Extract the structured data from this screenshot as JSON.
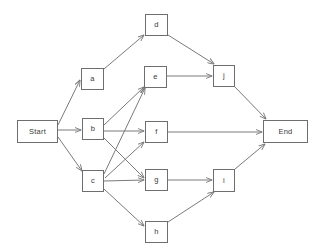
{
  "diagram": {
    "background_color": "#ffffff",
    "node_border_color": "#6e6e6e",
    "edge_color": "#7a7a7a",
    "text_color": "#3a3a3a",
    "nodes": [
      {
        "id": "start",
        "label": "Start",
        "x": 17,
        "y": 120,
        "w": 41,
        "h": 23
      },
      {
        "id": "a",
        "label": "a",
        "x": 81,
        "y": 68,
        "w": 23,
        "h": 22
      },
      {
        "id": "b",
        "label": "b",
        "x": 82,
        "y": 118,
        "w": 22,
        "h": 22
      },
      {
        "id": "c",
        "label": "c",
        "x": 82,
        "y": 170,
        "w": 22,
        "h": 22
      },
      {
        "id": "d",
        "label": "d",
        "x": 145,
        "y": 14,
        "w": 23,
        "h": 22
      },
      {
        "id": "e",
        "label": "e",
        "x": 144,
        "y": 66,
        "w": 23,
        "h": 22
      },
      {
        "id": "f",
        "label": "f",
        "x": 145,
        "y": 121,
        "w": 23,
        "h": 22
      },
      {
        "id": "g",
        "label": "g",
        "x": 145,
        "y": 169,
        "w": 23,
        "h": 22
      },
      {
        "id": "h",
        "label": "h",
        "x": 145,
        "y": 221,
        "w": 23,
        "h": 22
      },
      {
        "id": "j",
        "label": "j",
        "x": 213,
        "y": 65,
        "w": 22,
        "h": 22
      },
      {
        "id": "i",
        "label": "i",
        "x": 213,
        "y": 169,
        "w": 22,
        "h": 23
      },
      {
        "id": "end",
        "label": "End",
        "x": 263,
        "y": 120,
        "w": 45,
        "h": 23
      }
    ],
    "edges": [
      {
        "from": "start",
        "to": "a",
        "x1": 58,
        "y1": 125,
        "x2": 80,
        "y2": 80
      },
      {
        "from": "start",
        "to": "b",
        "x1": 58,
        "y1": 130,
        "x2": 81,
        "y2": 130
      },
      {
        "from": "start",
        "to": "c",
        "x1": 58,
        "y1": 137,
        "x2": 82,
        "y2": 171
      },
      {
        "from": "a",
        "to": "d",
        "x1": 104,
        "y1": 69,
        "x2": 144,
        "y2": 35
      },
      {
        "from": "d",
        "to": "j",
        "x1": 168,
        "y1": 35,
        "x2": 214,
        "y2": 64
      },
      {
        "from": "b",
        "to": "e",
        "x1": 104,
        "y1": 125,
        "x2": 144,
        "y2": 87
      },
      {
        "from": "b",
        "to": "f",
        "x1": 104,
        "y1": 131,
        "x2": 144,
        "y2": 131
      },
      {
        "from": "b",
        "to": "g",
        "x1": 104,
        "y1": 138,
        "x2": 144,
        "y2": 178
      },
      {
        "from": "c",
        "to": "e",
        "x1": 104,
        "y1": 174,
        "x2": 145,
        "y2": 88
      },
      {
        "from": "c",
        "to": "f",
        "x1": 105,
        "y1": 178,
        "x2": 144,
        "y2": 142
      },
      {
        "from": "c",
        "to": "g",
        "x1": 104,
        "y1": 181,
        "x2": 144,
        "y2": 180
      },
      {
        "from": "c",
        "to": "h",
        "x1": 104,
        "y1": 189,
        "x2": 144,
        "y2": 226
      },
      {
        "from": "e",
        "to": "j",
        "x1": 167,
        "y1": 76,
        "x2": 212,
        "y2": 76
      },
      {
        "from": "f",
        "to": "end",
        "x1": 168,
        "y1": 132,
        "x2": 262,
        "y2": 132
      },
      {
        "from": "g",
        "to": "i",
        "x1": 168,
        "y1": 180,
        "x2": 212,
        "y2": 180
      },
      {
        "from": "h",
        "to": "i",
        "x1": 168,
        "y1": 222,
        "x2": 214,
        "y2": 192
      },
      {
        "from": "j",
        "to": "end",
        "x1": 235,
        "y1": 87,
        "x2": 266,
        "y2": 119
      },
      {
        "from": "i",
        "to": "end",
        "x1": 235,
        "y1": 169,
        "x2": 265,
        "y2": 144
      }
    ]
  }
}
